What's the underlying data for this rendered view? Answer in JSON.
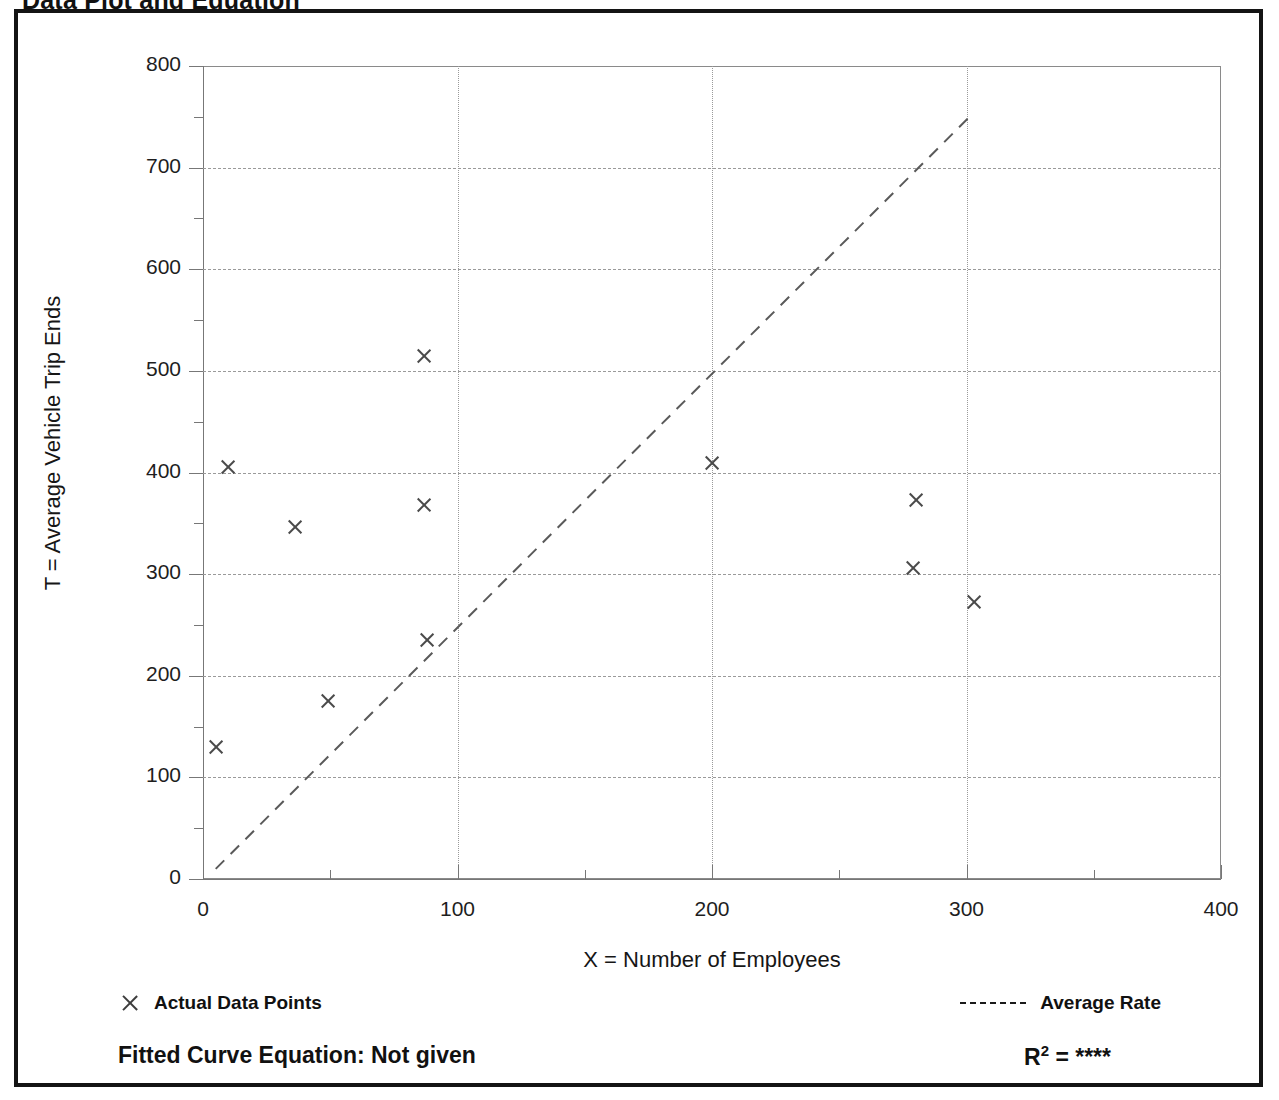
{
  "page_title": "Data Plot and Equation",
  "chart_data": {
    "type": "scatter",
    "title": "Data Plot and Equation",
    "xlabel": "X = Number of Employees",
    "ylabel": "T = Average Vehicle Trip Ends",
    "xlim": [
      0,
      400
    ],
    "ylim": [
      0,
      800
    ],
    "x_ticks": [
      0,
      100,
      200,
      300,
      400
    ],
    "y_ticks": [
      0,
      100,
      200,
      300,
      400,
      500,
      600,
      700,
      800
    ],
    "x_minor_step": 50,
    "y_minor_step": 50,
    "grid": true,
    "legend_position": "below-axes",
    "series": [
      {
        "name": "Actual Data Points",
        "type": "scatter",
        "marker": "x",
        "points": [
          {
            "x": 5,
            "y": 130
          },
          {
            "x": 10,
            "y": 405
          },
          {
            "x": 36,
            "y": 346
          },
          {
            "x": 49,
            "y": 175
          },
          {
            "x": 87,
            "y": 515
          },
          {
            "x": 87,
            "y": 368
          },
          {
            "x": 88,
            "y": 235
          },
          {
            "x": 200,
            "y": 409
          },
          {
            "x": 279,
            "y": 306
          },
          {
            "x": 280,
            "y": 373
          },
          {
            "x": 303,
            "y": 273
          }
        ]
      },
      {
        "name": "Average Rate",
        "type": "line",
        "style": "dashed",
        "endpoints": [
          {
            "x": 5,
            "y": 10
          },
          {
            "x": 302,
            "y": 752
          }
        ]
      }
    ]
  },
  "legend": {
    "data_points_label": "Actual Data Points",
    "average_rate_label": "Average Rate",
    "marker_icon": "x-marker-icon",
    "line_icon": "dashed-line-icon"
  },
  "footer": {
    "equation_label": "Fitted Curve Equation:  Not given",
    "r2_prefix": "R",
    "r2_exponent": "2",
    "r2_value": "= ****"
  },
  "colors": {
    "frame": "#141414",
    "axis": "#777777",
    "grid": "#9a9a9a",
    "marker": "#4a4a4a",
    "text": "#111111",
    "background": "#ffffff"
  }
}
